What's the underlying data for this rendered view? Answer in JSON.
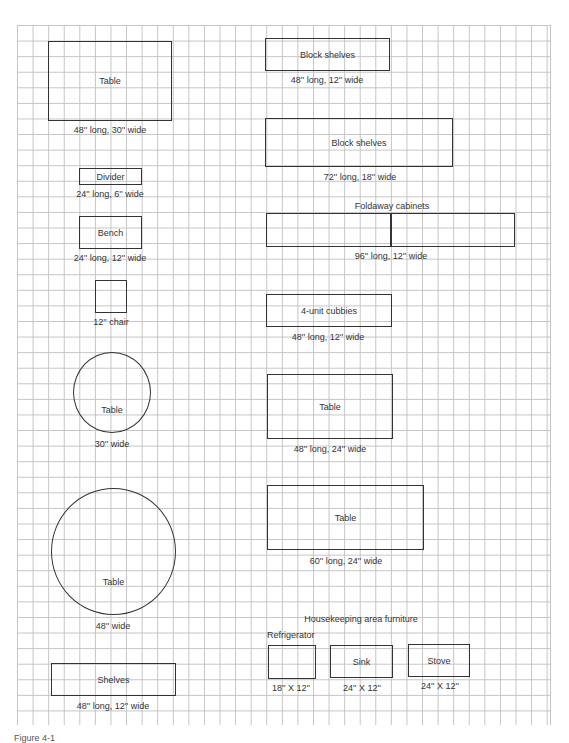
{
  "figure": {
    "caption": "Figure 4-1"
  },
  "left_column": [
    {
      "name": "Table",
      "dims": "48'' long, 30'' wide",
      "shape": "rect"
    },
    {
      "name": "Divider",
      "dims": "24'' long, 6'' wide",
      "shape": "rect"
    },
    {
      "name": "Bench",
      "dims": "24'' long, 12'' wide",
      "shape": "rect"
    },
    {
      "name": "",
      "dims": "12'' chair",
      "shape": "square"
    },
    {
      "name": "Table",
      "dims": "30'' wide",
      "shape": "circle"
    },
    {
      "name": "Table",
      "dims": "48'' wide",
      "shape": "circle"
    },
    {
      "name": "Shelves",
      "dims": "48'' long, 12'' wide",
      "shape": "rect"
    }
  ],
  "right_column": [
    {
      "name": "Block shelves",
      "dims": "48'' long, 12'' wide",
      "shape": "rect"
    },
    {
      "name": "Block shelves",
      "dims": "72'' long, 18'' wide",
      "shape": "rect"
    },
    {
      "title": "Foldaway cabinets",
      "dims": "96'' long, 12'' wide",
      "shape": "split-rect"
    },
    {
      "name": "4-unit cubbies",
      "dims": "48'' long, 12'' wide",
      "shape": "rect"
    },
    {
      "name": "Table",
      "dims": "48'' long, 24'' wide",
      "shape": "rect"
    },
    {
      "name": "Table",
      "dims": "60'' long, 24'' wide",
      "shape": "rect"
    }
  ],
  "housekeeping": {
    "title": "Housekeeping area furniture",
    "items": [
      {
        "name": "Refrigerator",
        "dims": "18'' X 12''"
      },
      {
        "name": "Sink",
        "dims": "24'' X 12''"
      },
      {
        "name": "Stove",
        "dims": "24'' X 12''"
      }
    ]
  }
}
